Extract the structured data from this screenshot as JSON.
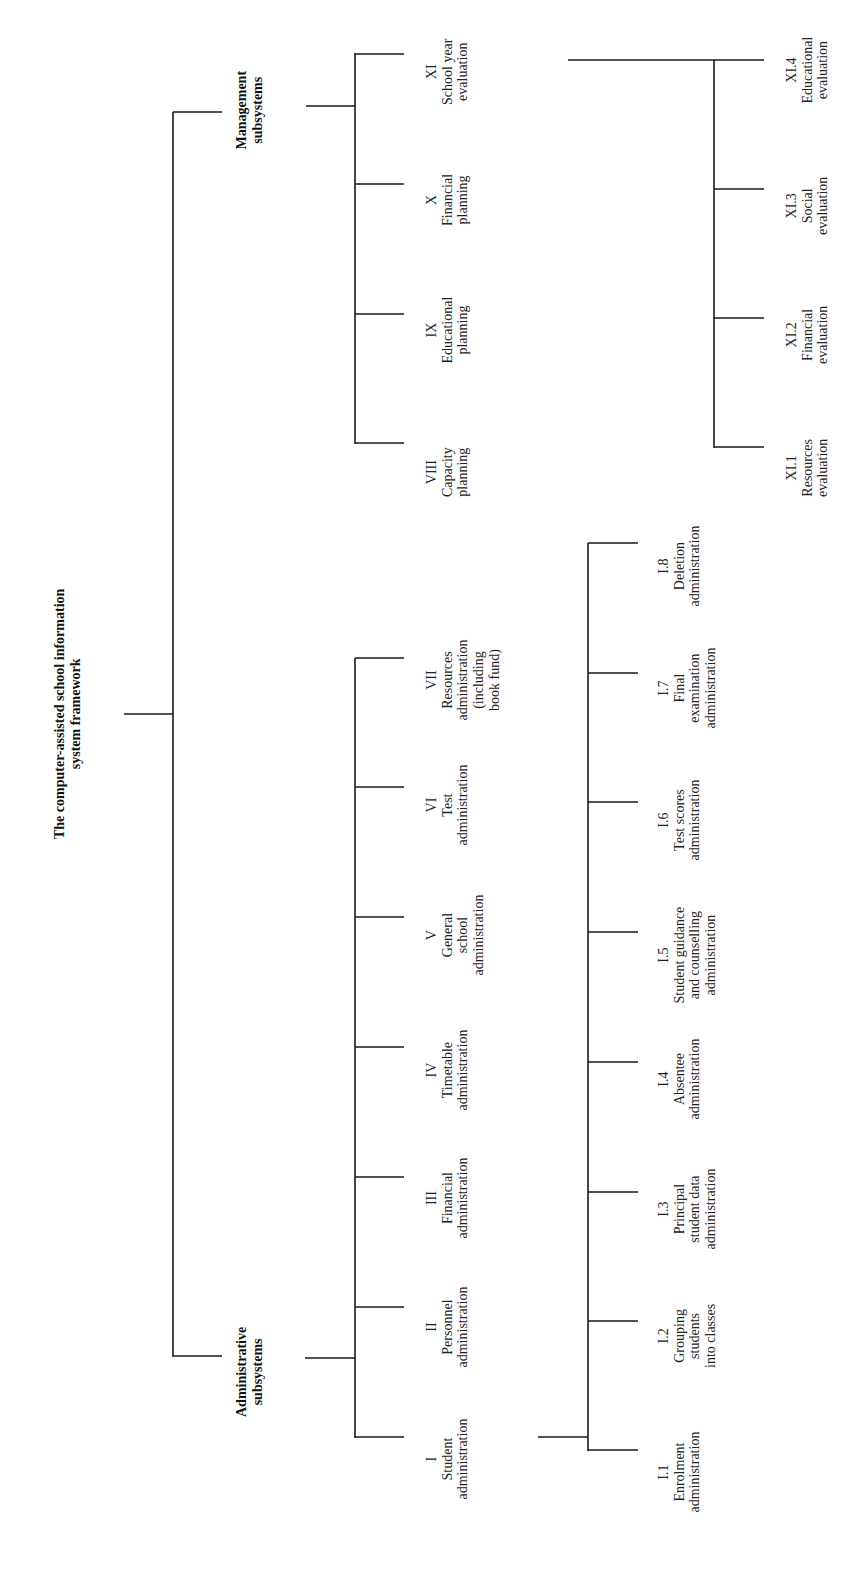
{
  "diagram": {
    "orientation": "rotated-90-ccw",
    "line_color": "#1a1a1a",
    "root": {
      "title_lines": [
        "The computer-assisted school information",
        "system framework"
      ]
    },
    "groups": [
      {
        "id": "management",
        "label_lines": [
          "Management",
          "subsystems"
        ],
        "children": [
          {
            "numeral": "VIII",
            "lines": [
              "Capacity",
              "planning"
            ]
          },
          {
            "numeral": "IX",
            "lines": [
              "Educational",
              "planning"
            ]
          },
          {
            "numeral": "X",
            "lines": [
              "Financial",
              "planning"
            ]
          },
          {
            "numeral": "XI",
            "lines": [
              "School year",
              "evaluation"
            ]
          }
        ]
      },
      {
        "id": "administrative",
        "label_lines": [
          "Administrative",
          "subsystems"
        ],
        "children": [
          {
            "numeral": "I",
            "lines": [
              "Student",
              "administration"
            ]
          },
          {
            "numeral": "II",
            "lines": [
              "Personnel",
              "administration"
            ]
          },
          {
            "numeral": "III",
            "lines": [
              "Financial",
              "administration"
            ]
          },
          {
            "numeral": "IV",
            "lines": [
              "Timetable",
              "administration"
            ]
          },
          {
            "numeral": "V",
            "lines": [
              "General",
              "school",
              "administration"
            ]
          },
          {
            "numeral": "VI",
            "lines": [
              "Test",
              "administration"
            ]
          },
          {
            "numeral": "VII",
            "lines": [
              "Resources",
              "administration",
              "(including",
              "book fund)"
            ]
          }
        ]
      }
    ],
    "subtrees": [
      {
        "parent": "I",
        "children": [
          {
            "numeral": "I.1",
            "lines": [
              "Enrolment",
              "administration"
            ]
          },
          {
            "numeral": "I.2",
            "lines": [
              "Grouping",
              "students",
              "into classes"
            ]
          },
          {
            "numeral": "I.3",
            "lines": [
              "Principal",
              "student data",
              "administration"
            ]
          },
          {
            "numeral": "I.4",
            "lines": [
              "Absentee",
              "administration"
            ]
          },
          {
            "numeral": "I.5",
            "lines": [
              "Student guidance",
              "and counselling",
              "administration"
            ]
          },
          {
            "numeral": "I.6",
            "lines": [
              "Test scores",
              "administration"
            ]
          },
          {
            "numeral": "I.7",
            "lines": [
              "Final",
              "examination",
              "administration"
            ]
          },
          {
            "numeral": "I.8",
            "lines": [
              "Deletion",
              "administration"
            ]
          }
        ]
      },
      {
        "parent": "XI",
        "children": [
          {
            "numeral": "XI.1",
            "lines": [
              "Resources",
              "evaluation"
            ]
          },
          {
            "numeral": "XI.2",
            "lines": [
              "Financial",
              "evaluation"
            ]
          },
          {
            "numeral": "XI.3",
            "lines": [
              "Social",
              "evaluation"
            ]
          },
          {
            "numeral": "XI.4",
            "lines": [
              "Educational",
              "evaluation"
            ]
          }
        ]
      }
    ]
  }
}
